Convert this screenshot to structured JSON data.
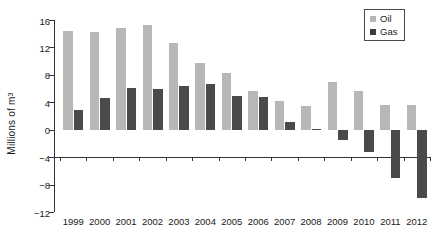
{
  "chart_data": {
    "type": "bar",
    "title": "",
    "subtitle": "",
    "xlabel": "",
    "ylabel": "Millions of m³",
    "ylabel_base": "Millions of m",
    "ylabel_exponent": "3",
    "ylim": [
      -12,
      16
    ],
    "ytick_values": [
      16,
      12,
      8,
      4,
      0,
      -4,
      -8,
      -12
    ],
    "ytick_labels": [
      "16",
      "12",
      "8",
      "4",
      "0",
      "−4",
      "−8",
      "−12"
    ],
    "grid": false,
    "legend_position": "top-right",
    "categories": [
      "1999",
      "2000",
      "2001",
      "2002",
      "2003",
      "2004",
      "2005",
      "2006",
      "2007",
      "2008",
      "2009",
      "2010",
      "2011",
      "2012"
    ],
    "series": [
      {
        "name": "Oil",
        "color": "#b7b7b7",
        "values": [
          14.4,
          14.2,
          14.8,
          15.2,
          12.7,
          9.7,
          8.2,
          5.7,
          4.2,
          3.5,
          6.9,
          5.6,
          3.6,
          3.6
        ]
      },
      {
        "name": "Gas",
        "color": "#4a4a4a",
        "values": [
          2.9,
          4.6,
          6.1,
          5.9,
          6.4,
          6.6,
          4.9,
          4.8,
          1.1,
          0.1,
          -1.5,
          -3.3,
          -7.0,
          -10.0
        ]
      }
    ]
  },
  "legend": {
    "items": [
      {
        "label": "Oil",
        "swatch": "oil"
      },
      {
        "label": "Gas",
        "swatch": "gas"
      }
    ]
  }
}
